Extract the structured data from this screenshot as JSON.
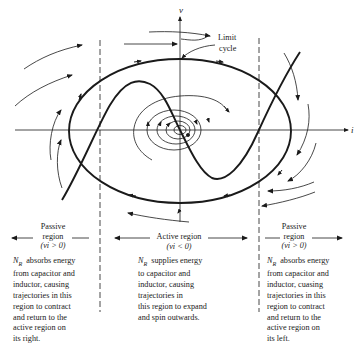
{
  "diagram": {
    "axes": {
      "x_label": "i",
      "y_label": "v"
    },
    "annotations": {
      "limit_cycle": [
        "Limit",
        "cycle"
      ]
    },
    "regions": [
      {
        "id": "left-passive",
        "title_line1": "Passive",
        "title_line2": "region",
        "condition": "(vi > 0)",
        "description_prefix": "N",
        "description_subscript": "R",
        "description_lines": [
          "absorbs energy",
          "from capacitor and",
          "inductor, causing",
          "trajectories in this",
          "region to contract",
          "and return to the",
          "active region on",
          "its right."
        ]
      },
      {
        "id": "active",
        "title_line1": "Active region",
        "condition": "(vi < 0)",
        "description_prefix": "N",
        "description_subscript": "R",
        "description_lines": [
          "supplies energy",
          "to capacitor and",
          "inductor, causing",
          "trajectories in",
          "this region to expand",
          "and spin outwards."
        ]
      },
      {
        "id": "right-passive",
        "title_line1": "Passive",
        "title_line2": "region",
        "condition": "(vi > 0)",
        "description_prefix": "N",
        "description_subscript": "R",
        "description_lines": [
          "absorbs energy",
          "from capacitor and",
          "inductor, cuasing",
          "trajectories in this",
          "region to contract",
          "and return to the",
          "active region on",
          "its left."
        ]
      }
    ],
    "colors": {
      "ink": "#1a1a1a",
      "background": "#ffffff"
    }
  }
}
